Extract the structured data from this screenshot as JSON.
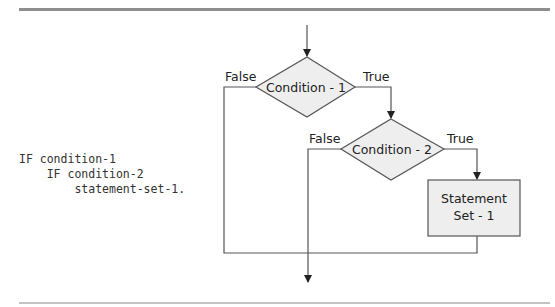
{
  "code": {
    "lines": [
      "IF condition-1",
      "    IF condition-2",
      "        statement-set-1."
    ]
  },
  "diagram": {
    "decision1": {
      "label": "Condition - 1",
      "true_label": "True",
      "false_label": "False"
    },
    "decision2": {
      "label": "Condition - 2",
      "true_label": "True",
      "false_label": "False"
    },
    "process1": {
      "line1": "Statement",
      "line2": "Set - 1"
    }
  },
  "colors": {
    "shape_fill": "#eeeeee",
    "line": "#555555",
    "rule": "#9a9a9a"
  }
}
